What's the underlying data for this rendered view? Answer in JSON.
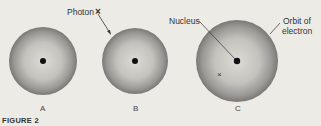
{
  "figure": {
    "caption": "FIGURE 2",
    "panels": [
      {
        "id": "A",
        "label": "A",
        "cx": 43,
        "cy": 61,
        "r": 34
      },
      {
        "id": "B",
        "label": "B",
        "cx": 135,
        "cy": 61,
        "r": 33
      },
      {
        "id": "C",
        "label": "C",
        "cx": 237,
        "cy": 61,
        "r": 41
      }
    ],
    "annotations": {
      "photon": "Photon",
      "photon_mark": "×",
      "nucleus": "Nucleus",
      "orbit_line1": "Orbit of",
      "orbit_line2": "electron",
      "electron_mark": "×"
    },
    "colors": {
      "background": "#ecebe6",
      "sphere_edge": "#7a7874",
      "sphere_center": "#d9d7d2",
      "nucleus": "#111111"
    }
  }
}
